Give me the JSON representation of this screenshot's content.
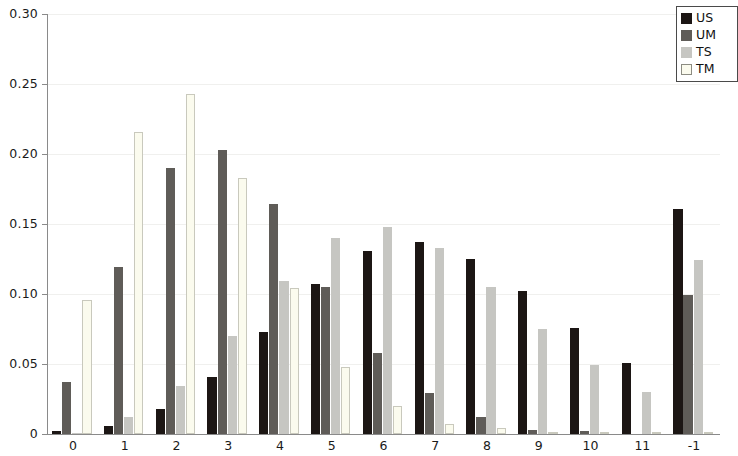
{
  "chart_data": {
    "type": "bar",
    "title": "",
    "xlabel": "",
    "ylabel": "",
    "ylim": [
      0,
      0.3
    ],
    "xlim_note": "13 category groups, last label clipped at image right edge",
    "grid": true,
    "legend_position": "top-right",
    "y_ticks": [
      "0",
      "0.05",
      "0.10",
      "0.15",
      "0.20",
      "0.25",
      "0.30"
    ],
    "y_tick_values": [
      0,
      0.05,
      0.1,
      0.15,
      0.2,
      0.25,
      0.3
    ],
    "categories": [
      "0",
      "1",
      "2",
      "3",
      "4",
      "5",
      "6",
      "7",
      "8",
      "9",
      "10",
      "11",
      "-1"
    ],
    "series": [
      {
        "name": "US",
        "color": "#1c1614",
        "values": [
          0.002,
          0.006,
          0.018,
          0.041,
          0.073,
          0.107,
          0.131,
          0.137,
          0.125,
          0.102,
          0.076,
          0.051,
          0.161
        ]
      },
      {
        "name": "UM",
        "color": "#5f5c58",
        "values": [
          0.037,
          0.119,
          0.19,
          0.203,
          0.164,
          0.105,
          0.058,
          0.029,
          0.012,
          0.003,
          0.002,
          0.0,
          0.099
        ]
      },
      {
        "name": "TS",
        "color": "#c6c6c2",
        "values": [
          0.001,
          0.012,
          0.034,
          0.07,
          0.109,
          0.14,
          0.148,
          0.133,
          0.105,
          0.075,
          0.049,
          0.03,
          0.124
        ]
      },
      {
        "name": "TM",
        "color": "#fbfbee",
        "values": [
          0.096,
          0.216,
          0.243,
          0.183,
          0.104,
          0.048,
          0.02,
          0.007,
          0.004,
          0.001,
          0.0,
          0.0,
          0.0
        ]
      }
    ]
  },
  "legend": {
    "entries": [
      {
        "label": "US",
        "swatch": "series-swatch-us"
      },
      {
        "label": "UM",
        "swatch": "series-swatch-um"
      },
      {
        "label": "TS",
        "swatch": "series-swatch-ts"
      },
      {
        "label": "TM",
        "swatch": "series-swatch-tm"
      }
    ]
  }
}
